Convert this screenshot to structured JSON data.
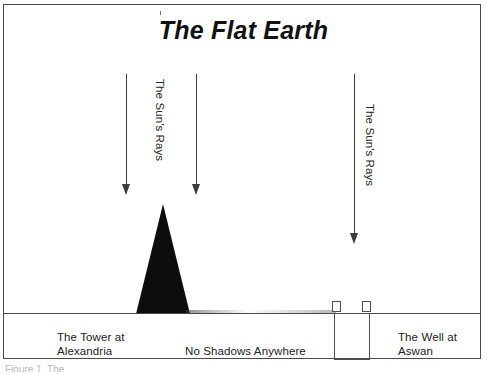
{
  "figure": {
    "title": "The Flat Earth",
    "clipped_caption": "Figure 1. The",
    "border_color": "#4a4a4a",
    "ink_color": "#0d0d0d",
    "background_color": "#ffffff"
  },
  "diagram": {
    "ground_label": "ground-line",
    "rays": [
      {
        "label": "",
        "name": "sun-ray-arrow-left"
      },
      {
        "label": "",
        "name": "sun-ray-arrow-middle"
      },
      {
        "label": "",
        "name": "sun-ray-arrow-right"
      }
    ],
    "ray_labels": {
      "left": "The Sun's Rays",
      "right": "The Sun's Rays"
    },
    "objects": {
      "tower": {
        "caption_line1": "The Tower at",
        "caption_line2": "Alexandria"
      },
      "well": {
        "caption_line1": "The Well at",
        "caption_line2": "Aswan"
      }
    },
    "center_caption": "No Shadows Anywhere"
  }
}
